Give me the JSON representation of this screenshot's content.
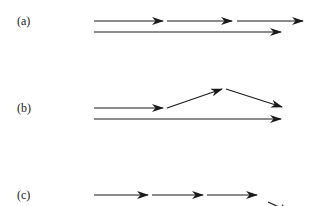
{
  "panels": [
    {
      "label": "(a)",
      "label_pos": [
        17,
        21
      ],
      "arrows": [
        {
          "x1": 94,
          "y1": 21,
          "x2": 163,
          "y2": 21
        },
        {
          "x1": 167,
          "y1": 21,
          "x2": 232,
          "y2": 21
        },
        {
          "x1": 237,
          "y1": 21,
          "x2": 303,
          "y2": 21
        },
        {
          "x1": 94,
          "y1": 32,
          "x2": 281,
          "y2": 32
        }
      ]
    },
    {
      "label": "(b)",
      "label_pos": [
        17,
        108
      ],
      "arrows": [
        {
          "x1": 94,
          "y1": 108,
          "x2": 163,
          "y2": 108
        },
        {
          "x1": 167,
          "y1": 108,
          "x2": 222,
          "y2": 89
        },
        {
          "x1": 226,
          "y1": 89,
          "x2": 282,
          "y2": 107
        },
        {
          "x1": 94,
          "y1": 119,
          "x2": 281,
          "y2": 119
        }
      ]
    },
    {
      "label": "(c)",
      "label_pos": [
        17,
        195
      ],
      "arrows": [
        {
          "x1": 94,
          "y1": 195,
          "x2": 148,
          "y2": 195
        },
        {
          "x1": 152,
          "y1": 195,
          "x2": 203,
          "y2": 195
        },
        {
          "x1": 207,
          "y1": 195,
          "x2": 257,
          "y2": 195
        },
        {
          "x1": 268,
          "y1": 202,
          "x2": 290,
          "y2": 212
        }
      ]
    }
  ],
  "colors": {
    "stroke": "#1a1a1a",
    "text": "#222222"
  }
}
